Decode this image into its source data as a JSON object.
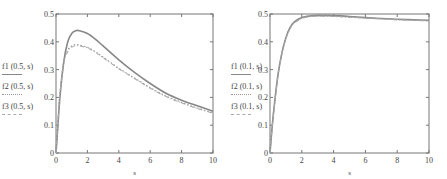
{
  "chart_data": [
    {
      "type": "line",
      "title": "",
      "xlabel": "s",
      "ylabel": "",
      "xlim": [
        0,
        10
      ],
      "ylim": [
        0,
        0.5
      ],
      "xticks": [
        "0",
        "2",
        "4",
        "6",
        "8",
        "10"
      ],
      "yticks": [
        "0",
        "0.1",
        "0.2",
        "0.3",
        "0.4",
        "0.5"
      ],
      "grid": false,
      "legend_position": "left",
      "x": [
        0,
        0.1,
        0.25,
        0.5,
        0.75,
        1,
        1.25,
        1.5,
        2,
        2.5,
        3,
        4,
        5,
        6,
        7,
        8,
        9,
        10
      ],
      "series": [
        {
          "name": "f1 (0.5, s)",
          "style": "solid",
          "color": "#888888",
          "values": [
            0,
            0.08,
            0.2,
            0.33,
            0.4,
            0.43,
            0.44,
            0.44,
            0.43,
            0.41,
            0.385,
            0.335,
            0.29,
            0.25,
            0.215,
            0.19,
            0.17,
            0.15
          ]
        },
        {
          "name": "f2 (0.5, s)",
          "style": "dotted",
          "color": "#999999",
          "values": [
            0,
            0.09,
            0.22,
            0.33,
            0.37,
            0.385,
            0.39,
            0.388,
            0.38,
            0.365,
            0.345,
            0.305,
            0.27,
            0.235,
            0.205,
            0.182,
            0.162,
            0.145
          ]
        },
        {
          "name": "f3 (0.5, s)",
          "style": "dashdot",
          "color": "#aaaaaa",
          "values": [
            0,
            0.085,
            0.21,
            0.32,
            0.365,
            0.38,
            0.386,
            0.385,
            0.378,
            0.363,
            0.343,
            0.303,
            0.268,
            0.233,
            0.203,
            0.18,
            0.16,
            0.143
          ]
        }
      ]
    },
    {
      "type": "line",
      "title": "",
      "xlabel": "s",
      "ylabel": "",
      "xlim": [
        0,
        10
      ],
      "ylim": [
        0,
        0.5
      ],
      "xticks": [
        "0",
        "2",
        "4",
        "6",
        "8",
        "10"
      ],
      "yticks": [
        "0",
        "0.1",
        "0.2",
        "0.3",
        "0.4",
        "0.5"
      ],
      "grid": false,
      "legend_position": "left",
      "x": [
        0,
        0.1,
        0.25,
        0.5,
        0.75,
        1,
        1.25,
        1.5,
        2,
        2.5,
        3,
        4,
        5,
        6,
        7,
        8,
        9,
        10
      ],
      "series": [
        {
          "name": "f1 (0.1, s)",
          "style": "solid",
          "color": "#888888",
          "values": [
            0,
            0.07,
            0.16,
            0.28,
            0.36,
            0.415,
            0.45,
            0.47,
            0.487,
            0.493,
            0.495,
            0.494,
            0.491,
            0.487,
            0.484,
            0.481,
            0.479,
            0.477
          ]
        },
        {
          "name": "f2 (0.1, s)",
          "style": "dotted",
          "color": "#999999",
          "values": [
            0,
            0.07,
            0.16,
            0.28,
            0.36,
            0.413,
            0.448,
            0.468,
            0.485,
            0.491,
            0.493,
            0.492,
            0.489,
            0.486,
            0.483,
            0.48,
            0.478,
            0.476
          ]
        },
        {
          "name": "f3 (0.1, s)",
          "style": "dashdot",
          "color": "#aaaaaa",
          "values": [
            0,
            0.068,
            0.158,
            0.278,
            0.358,
            0.41,
            0.445,
            0.466,
            0.484,
            0.49,
            0.492,
            0.491,
            0.488,
            0.485,
            0.482,
            0.479,
            0.477,
            0.475
          ]
        }
      ]
    }
  ]
}
